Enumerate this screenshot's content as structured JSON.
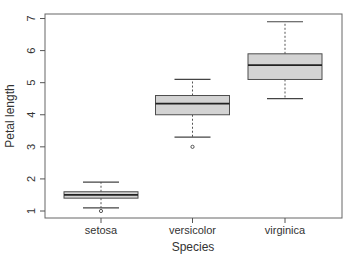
{
  "chart_data": {
    "type": "boxplot",
    "title": "",
    "xlabel": "Species",
    "ylabel": "Petal length",
    "categories": [
      "setosa",
      "versicolor",
      "virginica"
    ],
    "ylim": [
      0.8,
      7.1
    ],
    "yticks": [
      1,
      2,
      3,
      4,
      5,
      6,
      7
    ],
    "grid": false,
    "legend": null,
    "series": [
      {
        "name": "setosa",
        "whisker_low": 1.1,
        "q1": 1.4,
        "median": 1.5,
        "q3": 1.6,
        "whisker_high": 1.9,
        "outliers": [
          1.0
        ]
      },
      {
        "name": "versicolor",
        "whisker_low": 3.3,
        "q1": 4.0,
        "median": 4.35,
        "q3": 4.6,
        "whisker_high": 5.1,
        "outliers": [
          3.0
        ]
      },
      {
        "name": "virginica",
        "whisker_low": 4.5,
        "q1": 5.1,
        "median": 5.55,
        "q3": 5.9,
        "whisker_high": 6.9,
        "outliers": []
      }
    ],
    "colors": {
      "box_fill": "#d3d3d3",
      "box_stroke": "#4d4d4d",
      "median": "#222222",
      "axis": "#555555"
    }
  }
}
